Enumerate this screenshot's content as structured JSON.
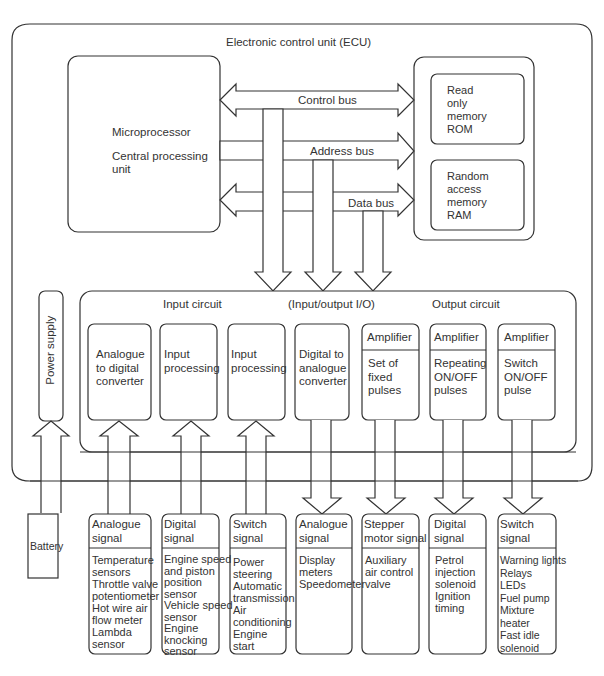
{
  "ecu": {
    "title": "Electronic control unit (ECU)",
    "cpu": {
      "line1": "Microprocessor",
      "line2": "Central processing",
      "line3": "unit"
    },
    "rom": {
      "lines": [
        "Read",
        "only",
        "memory",
        "ROM"
      ]
    },
    "ram": {
      "lines": [
        "Random",
        "access",
        "memory",
        "RAM"
      ]
    },
    "buses": {
      "control": "Control bus",
      "address": "Address bus",
      "data": "Data bus"
    },
    "io": {
      "input_label": "Input circuit",
      "io_label": "(Input/output I/O)",
      "output_label": "Output circuit",
      "blocks": [
        {
          "header": "",
          "lines": [
            "Analogue",
            "to digital",
            "converter"
          ]
        },
        {
          "header": "",
          "lines": [
            "Input",
            "processing"
          ]
        },
        {
          "header": "",
          "lines": [
            "Input",
            "processing"
          ]
        },
        {
          "header": "",
          "lines": [
            "Digital to",
            "analogue",
            "converter"
          ]
        },
        {
          "header": "Amplifier",
          "lines": [
            "Set of",
            "fixed",
            "pulses"
          ]
        },
        {
          "header": "Amplifier",
          "lines": [
            "Repeating",
            "ON/OFF",
            "pulses"
          ]
        },
        {
          "header": "Amplifier",
          "lines": [
            "Switch",
            "ON/OFF",
            "pulse"
          ]
        }
      ]
    },
    "power_supply": "Power supply"
  },
  "battery": "Battery",
  "signals": [
    {
      "header": [
        "Analogue",
        "signal"
      ],
      "items": [
        "Temperature",
        "sensors",
        "Throttle valve",
        "potentiometer",
        "Hot wire air",
        "flow meter",
        "Lambda",
        "sensor"
      ]
    },
    {
      "header": [
        "Digital",
        "signal"
      ],
      "items": [
        "Engine speed",
        "and piston",
        "position",
        "sensor",
        "Vehicle speed",
        "sensor",
        "Engine",
        "knocking",
        "sensor"
      ]
    },
    {
      "header": [
        "Switch",
        "signal"
      ],
      "items": [
        "Power",
        "steering",
        "Automatic",
        "transmission",
        "Air",
        "conditioning",
        "Engine",
        "start"
      ]
    },
    {
      "header": [
        "Analogue",
        "signal"
      ],
      "items": [
        "Display",
        "meters",
        "Speedometer"
      ]
    },
    {
      "header": [
        "Stepper",
        "motor signal"
      ],
      "items": [
        "Auxiliary",
        "air control",
        "valve"
      ]
    },
    {
      "header": [
        "Digital",
        "signal"
      ],
      "items": [
        "Petrol",
        "injection",
        "solenoid",
        "Ignition",
        "timing"
      ]
    },
    {
      "header": [
        "Switch",
        "signal"
      ],
      "items": [
        "Warning lights",
        "Relays",
        "LEDs",
        "Fuel pump",
        "Mixture",
        "heater",
        "Fast idle",
        "solenoid"
      ]
    }
  ]
}
